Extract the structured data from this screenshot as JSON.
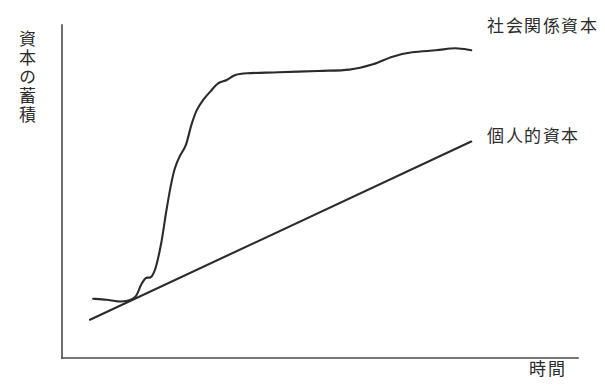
{
  "chart_data": {
    "type": "line",
    "title": "",
    "subtitle": "",
    "xlabel": "時間",
    "ylabel": "資本の蓄積",
    "grid": false,
    "legend_position": "inline-right-end",
    "axes": {
      "x_axis_label": "時間",
      "y_axis_label": "資本の蓄積",
      "x_ticks": [],
      "y_ticks": [],
      "xlim": [
        0,
        100
      ],
      "ylim": [
        0,
        100
      ]
    },
    "annotations": [
      {
        "name": "social-capital-annotation",
        "text": "社会関係資本",
        "attached_series": "社会関係資本"
      },
      {
        "name": "personal-capital-annotation",
        "text": "個人的資本",
        "attached_series": "個人的資本"
      }
    ],
    "series": [
      {
        "name": "社会関係資本",
        "shape": "s-curve",
        "color": "#2b2b2b",
        "label": "社会関係資本",
        "points": [
          {
            "x": 0.8,
            "y": 17.8
          },
          {
            "x": 4.2,
            "y": 17.5
          },
          {
            "x": 7.0,
            "y": 17.0
          },
          {
            "x": 9.5,
            "y": 17.2
          },
          {
            "x": 11.6,
            "y": 18.5
          },
          {
            "x": 13.0,
            "y": 22.0
          },
          {
            "x": 14.2,
            "y": 24.0
          },
          {
            "x": 15.6,
            "y": 24.4
          },
          {
            "x": 16.8,
            "y": 27.5
          },
          {
            "x": 18.2,
            "y": 35.0
          },
          {
            "x": 19.4,
            "y": 44.0
          },
          {
            "x": 20.6,
            "y": 52.0
          },
          {
            "x": 21.6,
            "y": 57.0
          },
          {
            "x": 22.8,
            "y": 60.5
          },
          {
            "x": 24.4,
            "y": 64.0
          },
          {
            "x": 25.8,
            "y": 70.0
          },
          {
            "x": 27.2,
            "y": 74.5
          },
          {
            "x": 28.8,
            "y": 77.5
          },
          {
            "x": 30.6,
            "y": 80.0
          },
          {
            "x": 32.6,
            "y": 82.5
          },
          {
            "x": 34.8,
            "y": 83.5
          },
          {
            "x": 37.0,
            "y": 85.0
          },
          {
            "x": 40.0,
            "y": 85.5
          },
          {
            "x": 48.0,
            "y": 85.8
          },
          {
            "x": 58.0,
            "y": 86.2
          },
          {
            "x": 66.0,
            "y": 86.6
          },
          {
            "x": 72.0,
            "y": 88.2
          },
          {
            "x": 77.0,
            "y": 90.5
          },
          {
            "x": 82.0,
            "y": 91.8
          },
          {
            "x": 88.0,
            "y": 92.4
          },
          {
            "x": 93.0,
            "y": 93.0
          },
          {
            "x": 97.0,
            "y": 92.4
          }
        ]
      },
      {
        "name": "個人的資本",
        "shape": "straight-line",
        "color": "#2b2b2b",
        "label": "個人的資本",
        "points": [
          {
            "x": 0.0,
            "y": 11.5
          },
          {
            "x": 97.0,
            "y": 65.0
          }
        ]
      }
    ]
  },
  "labels": {
    "y_axis": "資本の蓄積",
    "x_axis": "時間",
    "social_capital": "社会関係資本",
    "personal_capital": "個人的資本"
  }
}
